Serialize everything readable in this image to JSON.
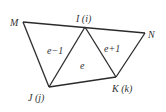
{
  "diagram": {
    "type": "triangular-mesh",
    "vertices": [
      {
        "id": "M",
        "label": "M",
        "x": 23,
        "y": 22
      },
      {
        "id": "I",
        "label": "I (i)",
        "x": 85,
        "y": 27
      },
      {
        "id": "N",
        "label": "N",
        "x": 145,
        "y": 33
      },
      {
        "id": "J",
        "label": "J (j)",
        "x": 49,
        "y": 87
      },
      {
        "id": "K",
        "label": "K (k)",
        "x": 116,
        "y": 77
      }
    ],
    "elements": [
      {
        "label": "e−1",
        "vertices": [
          "M",
          "I",
          "J"
        ]
      },
      {
        "label": "e",
        "vertices": [
          "I",
          "J",
          "K"
        ]
      },
      {
        "label": "e+1",
        "vertices": [
          "I",
          "K",
          "N"
        ]
      }
    ],
    "edge_color": "#2b2b2b"
  }
}
